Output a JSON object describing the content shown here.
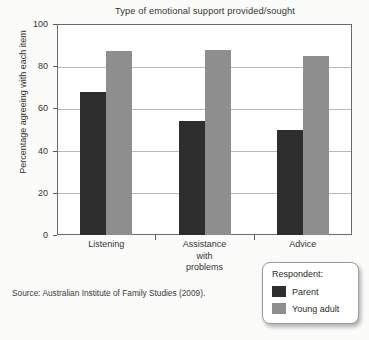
{
  "chart_data": {
    "type": "bar",
    "title": "Type of emotional support provided/sought",
    "xlabel": "",
    "ylabel": "Percentage agreeing with each item",
    "ylim": [
      0,
      100
    ],
    "yticks": [
      0,
      20,
      40,
      60,
      80,
      100
    ],
    "grid": true,
    "legend_position": "bottom-right",
    "legend_title": "Respondent:",
    "categories": [
      "Listening",
      "Assistance\nwith\nproblems",
      "Advice"
    ],
    "category_lines": [
      [
        "Listening"
      ],
      [
        "Assistance",
        "with",
        "problems"
      ],
      [
        "Advice"
      ]
    ],
    "series": [
      {
        "name": "Parent",
        "color": "#2e2e2e",
        "values": [
          68,
          54,
          50
        ]
      },
      {
        "name": "Young adult",
        "color": "#8e8e8e",
        "values": [
          87,
          87.5,
          85
        ]
      }
    ],
    "source": "Source: Australian Institute of Family Studies (2009)."
  }
}
